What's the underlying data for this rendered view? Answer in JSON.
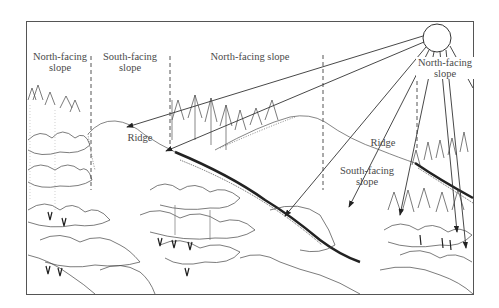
{
  "diagram": {
    "type": "illustration",
    "colors": {
      "line": "#333333",
      "frame": "#555555",
      "text": "#4a4a4a",
      "background": "#ffffff"
    },
    "labels": {
      "north_facing_1": {
        "line1": "North-facing",
        "line2": "slope"
      },
      "south_facing_1": {
        "line1": "South-facing",
        "line2": "slope"
      },
      "north_facing_2": {
        "line1": "North-facing slope"
      },
      "north_facing_3": {
        "line1": "North-facing",
        "line2": "slope"
      },
      "ridge_1": "Ridge",
      "ridge_2": "Ridge",
      "south_facing_2": {
        "line1": "South-facing",
        "line2": "slope"
      }
    },
    "sun": {
      "cx": 437,
      "cy": 38,
      "r": 14
    },
    "rays": [
      {
        "to": [
          127,
          127
        ]
      },
      {
        "to": [
          166,
          151
        ]
      },
      {
        "to": [
          285,
          216
        ]
      },
      {
        "to": [
          349,
          207
        ]
      },
      {
        "to": [
          412,
          215
        ]
      },
      {
        "to": [
          454,
          232
        ]
      },
      {
        "to": [
          464,
          248
        ]
      },
      {
        "to": [
          473,
          88
        ]
      }
    ],
    "dividers": [
      91,
      170,
      323,
      417
    ]
  }
}
